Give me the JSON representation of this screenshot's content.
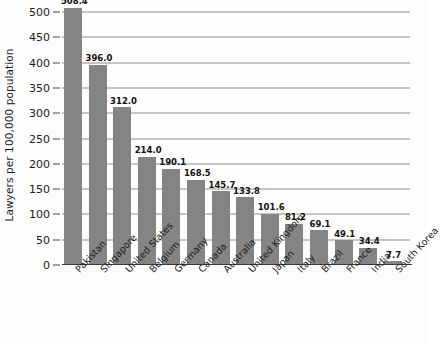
{
  "chart_data": {
    "type": "bar",
    "title": "",
    "xlabel": "",
    "ylabel": "Lawyers per 100,000 population",
    "ylim": [
      0,
      500
    ],
    "grid": true,
    "legend": "none",
    "y_ticks": [
      "0",
      "50",
      "100",
      "150",
      "200",
      "250",
      "300",
      "350",
      "400",
      "450",
      "500"
    ],
    "categories": [
      "Pakistan",
      "Singapore",
      "United States",
      "Belgium",
      "Germany",
      "Canada",
      "Australia",
      "United Kingdom",
      "Japan",
      "Italy",
      "Brazil",
      "France",
      "India",
      "South Korea"
    ],
    "values": [
      508.4,
      396.0,
      312.0,
      214.0,
      190.1,
      168.5,
      145.7,
      133.8,
      101.6,
      81.2,
      69.1,
      49.1,
      34.4,
      7.7
    ],
    "value_labels": [
      "508.4",
      "396.0",
      "312.0",
      "214.0",
      "190.1",
      "168.5",
      "145.7",
      "133.8",
      "101.6",
      "81.2",
      "69.1",
      "49.1",
      "34.4",
      "7.7"
    ],
    "bar_color": "#848484",
    "gridline_color": "#8d8d8d",
    "axis_color": "#3a3a3a",
    "background_color": "#fdfdfc"
  }
}
